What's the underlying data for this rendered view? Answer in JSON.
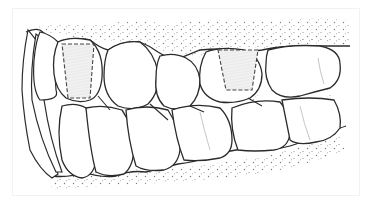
{
  "illustration": {
    "subject": "side view of dental arch (upper and lower teeth with gums)",
    "colors": {
      "background": "#ffffff",
      "outline": "#2b2b2b",
      "stipple": "#6a6a6a",
      "marked_fill": "#ededed",
      "marked_stripe": "#f7f7f7",
      "dashed_outline": "#444444",
      "frame": "#f2f2f2"
    },
    "marked_regions": [
      {
        "id": "upper-tooth-1",
        "shape": "dashed-trapezoid"
      },
      {
        "id": "upper-tooth-4",
        "shape": "dashed-trapezoid"
      }
    ]
  }
}
